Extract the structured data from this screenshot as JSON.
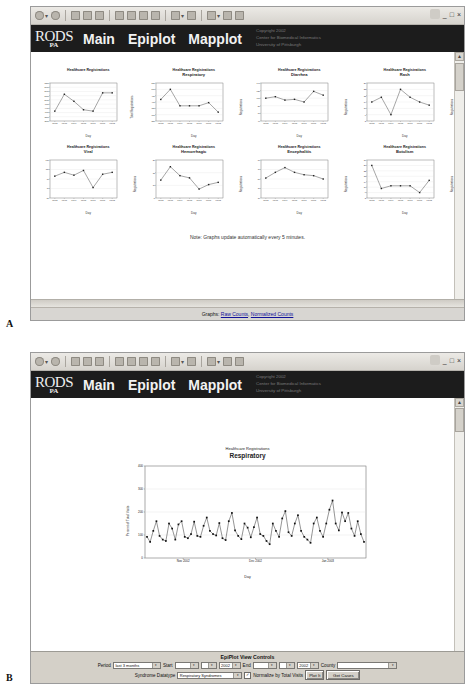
{
  "panels": {
    "a_letter": "A",
    "b_letter": "B"
  },
  "window": {
    "minimize": "_",
    "maximize": "□",
    "close": "×",
    "toolbar_icons": [
      "back-icon",
      "forward-icon",
      "stop-icon",
      "refresh-icon",
      "home-icon",
      "search-icon",
      "favorites-icon",
      "history-icon",
      "mail-icon",
      "print-icon",
      "edit-icon",
      "discuss-icon",
      "messenger-icon"
    ]
  },
  "banner": {
    "logo_main": "RODS",
    "logo_sub": "PA",
    "nav": [
      "Main",
      "Epiplot",
      "Mapplot"
    ],
    "copyright_lines": [
      "Copyright 2002",
      "Center for Biomedical Informatics",
      "University of Pittsburgh"
    ]
  },
  "panel_a": {
    "note": "Note: Graphs update automatically every 5 minutes.",
    "status_prefix": "Graphs: ",
    "status_links": [
      "Raw Counts",
      "Normalized Counts"
    ],
    "status_separator": ", "
  },
  "panel_b": {
    "chart_title": "Healthcare Registrations",
    "chart_subtitle": "Respiratory",
    "controls_title": "EpiPlot View Controls",
    "period_label": "Period",
    "period_value": "last 3 months",
    "start_label": "Start",
    "start_month": "",
    "start_day": "",
    "start_year": "2002",
    "end_label": "End",
    "end_month": "",
    "end_day": "",
    "end_year": "2002",
    "county_label": "County",
    "county_value": "",
    "datatype_label": "Syndrome Datatype",
    "datatype_value": "Respiratory Syndromes",
    "normalize_label": "Normalize by Total Visits",
    "normalize_checked": "✓",
    "plot_button": "Plot It",
    "getcases_button": "Get Cases",
    "dropdown_arrow": "▾"
  },
  "chart_data": [
    {
      "type": "line",
      "title": "Healthcare Registrations",
      "subtitle": "",
      "xlabel": "Day",
      "ylabel": "Total Registrations",
      "categories": [
        "01/02",
        "01/03",
        "01/04",
        "01/05",
        "01/06",
        "01/07",
        "01/08"
      ],
      "values": [
        4200,
        5400,
        4900,
        4300,
        4200,
        5500,
        5500
      ],
      "ylim": [
        3500,
        6200
      ],
      "yticks": [
        "3500",
        "3800",
        "4100",
        "4400",
        "4700",
        "5000",
        "5300",
        "5600",
        "5900",
        "6200"
      ],
      "grid": true
    },
    {
      "type": "line",
      "title": "Healthcare Registrations",
      "subtitle": "Respiratory",
      "xlabel": "Day",
      "ylabel": "Registrations",
      "categories": [
        "01/02",
        "01/03",
        "01/04",
        "01/05",
        "01/06",
        "01/07",
        "01/08"
      ],
      "values": [
        420,
        500,
        370,
        370,
        370,
        395,
        320
      ],
      "ylim": [
        250,
        550
      ],
      "yticks": [
        "250",
        "300",
        "350",
        "400",
        "450",
        "500",
        "550"
      ],
      "grid": true
    },
    {
      "type": "line",
      "title": "Healthcare Registrations",
      "subtitle": "Diarrhea",
      "xlabel": "Day",
      "ylabel": "Registrations",
      "categories": [
        "01/02",
        "01/03",
        "01/04",
        "01/05",
        "01/06",
        "01/07",
        "01/08"
      ],
      "values": [
        100,
        104,
        95,
        97,
        90,
        118,
        108
      ],
      "ylim": [
        40,
        140
      ],
      "yticks": [
        "40",
        "60",
        "80",
        "100",
        "120",
        "140"
      ],
      "grid": true
    },
    {
      "type": "line",
      "title": "Healthcare Registrations",
      "subtitle": "Rash",
      "xlabel": "Day",
      "ylabel": "Registrations",
      "categories": [
        "01/02",
        "01/03",
        "01/04",
        "01/05",
        "01/06",
        "01/07",
        "01/08"
      ],
      "values": [
        14,
        17,
        6,
        22,
        17,
        14,
        12
      ],
      "ylim": [
        2,
        26
      ],
      "yticks": [
        "2",
        "6",
        "10",
        "14",
        "18",
        "22",
        "26"
      ],
      "grid": true
    },
    {
      "type": "line",
      "title": "Healthcare Registrations",
      "subtitle": "Viral",
      "xlabel": "Day",
      "ylabel": "Registrations",
      "categories": [
        "01/02",
        "01/03",
        "01/04",
        "01/05",
        "01/06",
        "01/07",
        "01/08"
      ],
      "values": [
        96,
        104,
        98,
        108,
        72,
        100,
        104
      ],
      "ylim": [
        50,
        130
      ],
      "yticks": [
        "50",
        "70",
        "90",
        "110",
        "130"
      ],
      "grid": true
    },
    {
      "type": "line",
      "title": "Healthcare Registrations",
      "subtitle": "Hemorrhagic",
      "xlabel": "Day",
      "ylabel": "Registrations",
      "categories": [
        "01/02",
        "01/03",
        "01/04",
        "01/05",
        "01/06",
        "01/07",
        "01/08"
      ],
      "values": [
        13,
        19,
        15,
        14,
        9,
        11,
        12
      ],
      "ylim": [
        5,
        22
      ],
      "yticks": [
        "5",
        "10",
        "15",
        "20"
      ],
      "grid": true
    },
    {
      "type": "line",
      "title": "Healthcare Registrations",
      "subtitle": "Encephalitis",
      "xlabel": "Day",
      "ylabel": "Registrations",
      "categories": [
        "01/02",
        "01/03",
        "01/04",
        "01/05",
        "01/06",
        "01/07",
        "01/08"
      ],
      "values": [
        52,
        64,
        74,
        64,
        59,
        57,
        50
      ],
      "ylim": [
        10,
        90
      ],
      "yticks": [
        "10",
        "30",
        "50",
        "70",
        "90"
      ],
      "grid": true
    },
    {
      "type": "line",
      "title": "Healthcare Registrations",
      "subtitle": "Botulism",
      "xlabel": "Day",
      "ylabel": "Registrations",
      "categories": [
        "01/02",
        "01/03",
        "01/04",
        "01/05",
        "01/06",
        "01/07",
        "01/08"
      ],
      "values": [
        26,
        9,
        11,
        11,
        11,
        6,
        15
      ],
      "ylim": [
        2,
        30
      ],
      "yticks": [
        "2",
        "6",
        "10",
        "14",
        "18",
        "22",
        "26",
        "30"
      ],
      "grid": true
    },
    {
      "type": "line",
      "title": "Healthcare Registrations",
      "subtitle": "Respiratory",
      "xlabel": "Day",
      "ylabel": "Percent of Total Visits",
      "ylim": [
        0,
        400
      ],
      "yticks": [
        "0",
        "100",
        "200",
        "300",
        "400"
      ],
      "xticks": [
        "Nov 2002",
        "Dec 2002",
        "Jan 2003"
      ],
      "grid": true,
      "values": [
        92,
        70,
        118,
        160,
        96,
        80,
        74,
        150,
        128,
        80,
        146,
        160,
        92,
        86,
        104,
        158,
        96,
        92,
        140,
        176,
        118,
        104,
        98,
        152,
        86,
        78,
        160,
        196,
        120,
        96,
        82,
        150,
        132,
        90,
        134,
        176,
        104,
        96,
        74,
        60,
        150,
        118,
        92,
        172,
        204,
        112,
        96,
        150,
        186,
        118,
        92,
        80,
        66,
        150,
        176,
        118,
        92,
        150,
        210,
        250,
        150,
        120,
        198,
        160,
        196,
        128,
        96,
        160,
        104,
        70
      ]
    }
  ]
}
